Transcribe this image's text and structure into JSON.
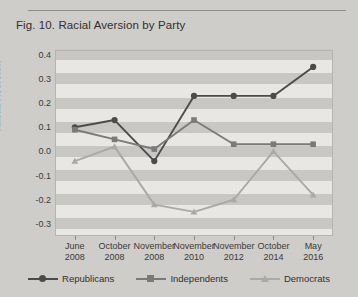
{
  "figure": {
    "caption": "Fig. 10. Racial Aversion by Party"
  },
  "chart_data": {
    "type": "line",
    "title": "Fig. 10. Racial Aversion by Party",
    "xlabel": "",
    "ylabel": "Racial Aversion",
    "categories": [
      "June 2008",
      "October 2008",
      "November 2008",
      "November 2010",
      "November 2012",
      "October 2014",
      "May 2016"
    ],
    "category_lines": [
      [
        "June",
        "2008"
      ],
      [
        "October",
        "2008"
      ],
      [
        "November",
        "2008"
      ],
      [
        "November",
        "2010"
      ],
      [
        "November",
        "2012"
      ],
      [
        "October",
        "2014"
      ],
      [
        "May",
        "2016"
      ]
    ],
    "ylim": [
      -0.35,
      0.42
    ],
    "yticks": [
      0.4,
      0.3,
      0.2,
      0.1,
      0.0,
      -0.1,
      -0.2,
      -0.3
    ],
    "ytick_labels": [
      "0.4",
      "0.3",
      "0.2",
      "0.1",
      "0.0",
      "-0.1",
      "-0.2",
      "-0.3"
    ],
    "grid": "horizontal-bands",
    "legend_position": "bottom",
    "series": [
      {
        "name": "Republicans",
        "marker": "circle",
        "color": "#4b4b4b",
        "values": [
          0.1,
          0.13,
          -0.04,
          0.23,
          0.23,
          0.23,
          0.35
        ]
      },
      {
        "name": "Independents",
        "marker": "square",
        "color": "#7a7a7a",
        "values": [
          0.09,
          0.05,
          0.01,
          0.13,
          0.03,
          0.03,
          0.03
        ]
      },
      {
        "name": "Democrats",
        "marker": "triangle",
        "color": "#a9a9a9",
        "values": [
          -0.04,
          0.02,
          -0.22,
          -0.25,
          -0.2,
          0.0,
          -0.18
        ]
      }
    ]
  },
  "colors": {
    "page_background": "#cfcdc9",
    "plot_background": "#e8e7e4",
    "band": "#c9c7c3",
    "axis": "#8e8c88",
    "text": "#2f2f2f"
  }
}
